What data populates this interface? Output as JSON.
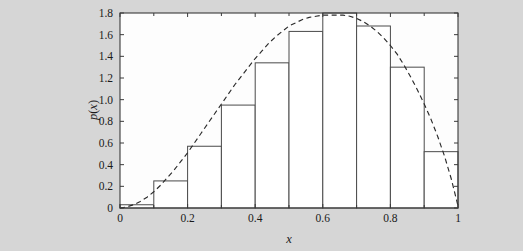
{
  "figure": {
    "background_color": "#d6d6d6",
    "plot_background_color": "#fdfdfd",
    "axis_color": "#3a3a3a"
  },
  "axes": {
    "x_title": "x",
    "y_title": "p(x)",
    "x_ticks": [
      "0",
      "0.2",
      "0.4",
      "0.6",
      "0.8",
      "1"
    ],
    "x_tick_values": [
      0,
      0.2,
      0.4,
      0.6,
      0.8,
      1
    ],
    "x_minor_tick_values": [
      0.1,
      0.3,
      0.5,
      0.7,
      0.9
    ],
    "y_ticks": [
      "0",
      "0.2",
      "0.4",
      "0.6",
      "0.8",
      "1.0",
      "1.2",
      "1.4",
      "1.6",
      "1.8"
    ],
    "y_tick_values": [
      0,
      0.2,
      0.4,
      0.6,
      0.8,
      1.0,
      1.2,
      1.4,
      1.6,
      1.8
    ]
  },
  "chart_data": {
    "type": "bar",
    "title": "",
    "subtitle": "",
    "xlabel": "x",
    "ylabel": "p(x)",
    "xlim": [
      0,
      1
    ],
    "ylim": [
      0,
      1.8
    ],
    "grid": false,
    "legend": false,
    "legend_position": "none",
    "bin_edges": [
      0.0,
      0.1,
      0.2,
      0.3,
      0.4,
      0.5,
      0.6,
      0.7,
      0.8,
      0.9,
      1.0
    ],
    "bin_centers": [
      0.05,
      0.15,
      0.25,
      0.35,
      0.45,
      0.55,
      0.65,
      0.75,
      0.85,
      0.95
    ],
    "categories": [
      "0.0-0.1",
      "0.1-0.2",
      "0.2-0.3",
      "0.3-0.4",
      "0.4-0.5",
      "0.5-0.6",
      "0.6-0.7",
      "0.7-0.8",
      "0.8-0.9",
      "0.9-1.0"
    ],
    "values": [
      0.03,
      0.25,
      0.57,
      0.95,
      1.34,
      1.63,
      1.8,
      1.68,
      1.3,
      0.52
    ],
    "series": [
      {
        "name": "histogram",
        "type": "bar",
        "values": [
          0.03,
          0.25,
          0.57,
          0.95,
          1.34,
          1.63,
          1.8,
          1.68,
          1.3,
          0.52
        ]
      },
      {
        "name": "density-curve",
        "type": "line",
        "style": "dashed",
        "x": [
          0.0,
          0.02,
          0.04,
          0.06,
          0.08,
          0.1,
          0.12,
          0.14,
          0.16,
          0.18,
          0.2,
          0.22,
          0.24,
          0.26,
          0.28,
          0.3,
          0.32,
          0.34,
          0.36,
          0.38,
          0.4,
          0.42,
          0.44,
          0.46,
          0.48,
          0.5,
          0.52,
          0.54,
          0.56,
          0.58,
          0.6,
          0.62,
          0.64,
          0.66,
          0.68,
          0.7,
          0.72,
          0.74,
          0.76,
          0.78,
          0.8,
          0.82,
          0.84,
          0.86,
          0.88,
          0.9,
          0.92,
          0.94,
          0.96,
          0.98,
          1.0
        ],
        "y": [
          0.0,
          0.01,
          0.03,
          0.06,
          0.1,
          0.15,
          0.21,
          0.28,
          0.35,
          0.43,
          0.51,
          0.6,
          0.69,
          0.78,
          0.87,
          0.96,
          1.05,
          1.14,
          1.22,
          1.3,
          1.38,
          1.45,
          1.52,
          1.58,
          1.63,
          1.68,
          1.71,
          1.74,
          1.76,
          1.77,
          1.78,
          1.78,
          1.78,
          1.78,
          1.77,
          1.75,
          1.72,
          1.68,
          1.63,
          1.57,
          1.5,
          1.42,
          1.32,
          1.21,
          1.09,
          0.96,
          0.82,
          0.66,
          0.48,
          0.27,
          0.02
        ]
      }
    ]
  }
}
